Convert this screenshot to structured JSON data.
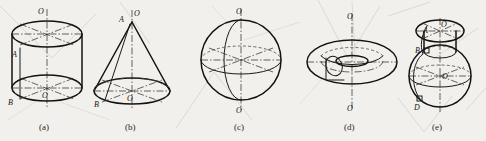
{
  "plate": {
    "title": "Solids of revolution",
    "background_color": "#f2f0ec",
    "ink_color": "#141210",
    "hidden_line_color": "#4a4744",
    "centerline_color": "#35322f",
    "showthrough_color": "#d8d5d0"
  },
  "figures": [
    {
      "id": "a",
      "caption": "(a)",
      "name": "cylinder",
      "labels": [
        {
          "text": "O",
          "role": "axis-top"
        },
        {
          "text": "A",
          "role": "generatrix-top"
        },
        {
          "text": "B",
          "role": "generatrix-bottom"
        },
        {
          "text": "O",
          "role": "axis-center-bottom"
        }
      ]
    },
    {
      "id": "b",
      "caption": "(b)",
      "name": "cone",
      "labels": [
        {
          "text": "A",
          "role": "apex"
        },
        {
          "text": "O",
          "role": "axis-top"
        },
        {
          "text": "B",
          "role": "base-left"
        },
        {
          "text": "O",
          "role": "base-center"
        }
      ]
    },
    {
      "id": "c",
      "caption": "(c)",
      "name": "sphere",
      "labels": [
        {
          "text": "O",
          "role": "axis-top"
        },
        {
          "text": "O",
          "role": "axis-bottom"
        }
      ]
    },
    {
      "id": "d",
      "caption": "(d)",
      "name": "torus",
      "labels": [
        {
          "text": "O",
          "role": "axis-top"
        },
        {
          "text": "O",
          "role": "axis-bottom"
        }
      ]
    },
    {
      "id": "e",
      "caption": "(e)",
      "name": "compound-vessel",
      "labels": [
        {
          "text": "A",
          "role": "neck-left"
        },
        {
          "text": "O",
          "role": "neck-center"
        },
        {
          "text": "B",
          "role": "shoulder-left"
        },
        {
          "text": "O",
          "role": "body-center"
        },
        {
          "text": "D",
          "role": "base-left"
        }
      ]
    }
  ]
}
